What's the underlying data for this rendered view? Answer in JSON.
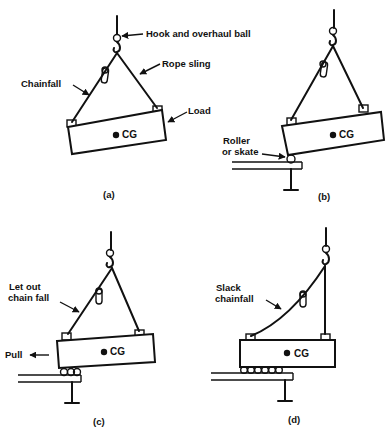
{
  "panels": [
    {
      "id": "a",
      "caption": "(a)",
      "cg_label": "CG",
      "labels": {
        "hook": "Hook and overhaul ball",
        "rope": "Rope sling",
        "chainfall": "Chainfall",
        "load": "Load"
      }
    },
    {
      "id": "b",
      "caption": "(b)",
      "cg_label": "CG",
      "labels": {
        "roller_line1": "Roller",
        "roller_line2": "or skate"
      }
    },
    {
      "id": "c",
      "caption": "(c)",
      "cg_label": "CG",
      "labels": {
        "letout_line1": "Let out",
        "letout_line2": "chain fall",
        "pull": "Pull"
      }
    },
    {
      "id": "d",
      "caption": "(d)",
      "cg_label": "CG",
      "labels": {
        "slack_line1": "Slack",
        "slack_line2": "chainfall"
      }
    }
  ]
}
